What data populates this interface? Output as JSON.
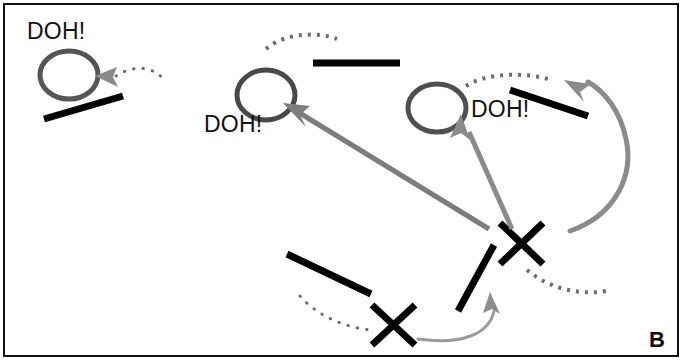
{
  "figure": {
    "panel_letter": "B",
    "colors": {
      "ink_black": "#111111",
      "bar_black": "#000000",
      "arrow_gray": "#7d7d7d",
      "arrow_gray_light": "#9a9a9a",
      "circle_gray": "#555555",
      "dotted_gray": "#6b6b6b",
      "frame": "#111111",
      "background": "#ffffff"
    },
    "labels": [
      {
        "id": "doh-1",
        "text": "DOH!",
        "x": 27,
        "y": 20
      },
      {
        "id": "doh-2",
        "text": "DOH!",
        "x": 204,
        "y": 113
      },
      {
        "id": "doh-3",
        "text": "DOH!",
        "x": 471,
        "y": 98
      }
    ],
    "circles": [
      {
        "id": "ball-1",
        "cx": 69,
        "cy": 75,
        "rx": 29,
        "ry": 24
      },
      {
        "id": "ball-2",
        "cx": 266,
        "cy": 95,
        "rx": 29,
        "ry": 25
      },
      {
        "id": "ball-3",
        "cx": 437,
        "cy": 108,
        "rx": 29,
        "ry": 24
      }
    ],
    "bars": [
      {
        "id": "bar-1",
        "x1": 44,
        "y1": 119,
        "x2": 123,
        "y2": 96
      },
      {
        "id": "bar-2",
        "x1": 313,
        "y1": 63,
        "x2": 400,
        "y2": 63
      },
      {
        "id": "bar-3",
        "x1": 510,
        "y1": 90,
        "x2": 588,
        "y2": 116
      },
      {
        "id": "bar-4",
        "x1": 287,
        "y1": 254,
        "x2": 371,
        "y2": 294
      },
      {
        "id": "bar-5",
        "x1": 458,
        "y1": 310,
        "x2": 494,
        "y2": 245
      }
    ],
    "x_marks": [
      {
        "id": "x-mark-1",
        "cx": 521,
        "cy": 243,
        "size": 27
      },
      {
        "id": "x-mark-2",
        "cx": 393,
        "cy": 324,
        "size": 27
      }
    ],
    "solid_arrows": [
      {
        "id": "arrow-long-left",
        "from": [
          489,
          228
        ],
        "to": [
          286,
          104
        ],
        "color": "#7d7d7d",
        "width": 5
      },
      {
        "id": "arrow-short-mid",
        "from": [
          513,
          230
        ],
        "to": [
          459,
          115
        ],
        "color": "#8b8b8b",
        "width": 5
      },
      {
        "id": "arrow-bottom-curve",
        "from": [
          420,
          338
        ],
        "to": [
          500,
          303
        ],
        "color": "#9a9a9a",
        "width": 3
      }
    ],
    "curved_arrows": [
      {
        "id": "arrow-right-sweep",
        "color": "#8b8b8b",
        "width": 5
      }
    ],
    "dotted_arcs": [
      {
        "id": "dotted-arc-1",
        "color": "#6b6b6b"
      },
      {
        "id": "dotted-arc-2",
        "color": "#6b6b6b"
      },
      {
        "id": "dotted-arc-3",
        "color": "#6b6b6b"
      },
      {
        "id": "dotted-arc-4",
        "color": "#6b6b6b"
      },
      {
        "id": "dotted-arc-5",
        "color": "#6b6b6b"
      }
    ],
    "small_arrowheads": [
      {
        "id": "arrowhead-topleft",
        "x": 104,
        "y": 79,
        "angle": 195,
        "color": "#888888"
      }
    ]
  }
}
